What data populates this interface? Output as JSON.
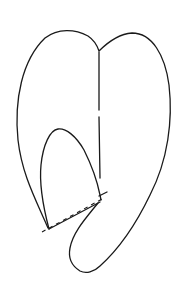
{
  "figure": {
    "type": "line-drawing",
    "stroke_color": "#1a1a1a",
    "background_color": "#ffffff",
    "parts": [
      {
        "name": "outer-outline",
        "style": "solid"
      },
      {
        "name": "midline",
        "style": "solid"
      },
      {
        "name": "inner-arch-flap",
        "style": "solid"
      },
      {
        "name": "fold-line",
        "style": "dashed"
      },
      {
        "name": "hook-extension",
        "style": "solid"
      }
    ]
  }
}
